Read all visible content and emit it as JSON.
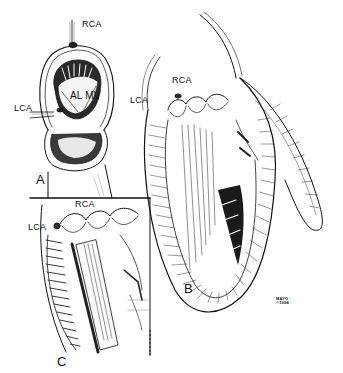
{
  "figure": {
    "colors": {
      "ink": "#111111",
      "background": "#ffffff"
    },
    "panels": [
      {
        "id": "A",
        "label": "A",
        "labels": {
          "rca": "RCA",
          "lca": "LCA",
          "valve": "AL MV"
        }
      },
      {
        "id": "B",
        "label": "B",
        "labels": {
          "rca": "RCA",
          "lca": "LCA"
        }
      },
      {
        "id": "C",
        "label": "C",
        "labels": {
          "rca": "RCA",
          "lca": "LCA"
        }
      }
    ],
    "signature": {
      "line1": "MAYO",
      "line2": "©1994"
    }
  }
}
